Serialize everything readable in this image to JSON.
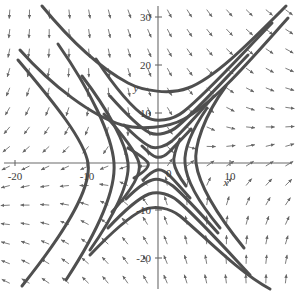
{
  "chart_data": {
    "type": "scatter",
    "title": "",
    "subtitle": "",
    "xlabel": "x",
    "ylabel": "y",
    "xlim": [
      -22.1,
      19.2
    ],
    "ylim": [
      -27.1,
      34.0
    ],
    "grid": false,
    "legend": null,
    "annotations": [],
    "plot_kind": "direction-field-phase-portrait",
    "xticks": [
      -20,
      -10,
      0,
      10
    ],
    "xtick_labels": [
      "-20",
      "-10",
      "0",
      "10"
    ],
    "yticks": [
      -20,
      -10,
      10,
      20,
      30
    ],
    "ytick_labels": [
      "-20",
      "-10",
      "10",
      "20",
      "30"
    ],
    "origin_label": "0",
    "field": {
      "arrow_color": "#5a5a5a",
      "arrow_count_x": 15,
      "arrow_count_y": 15,
      "quadrant_directions": {
        "upper_left": "up-left",
        "upper_right": "right-up",
        "lower_left": "down",
        "lower_right": "down-right"
      }
    },
    "trajectory_color": "#4f4f4f",
    "axis_color": "#6b6b6b",
    "background": "#ffffff",
    "trajectories": [
      {
        "name": "upper-branch-1",
        "quadrant": "top",
        "vertex": [
          0,
          16
        ]
      },
      {
        "name": "upper-branch-2",
        "quadrant": "top",
        "vertex": [
          0,
          8
        ]
      },
      {
        "name": "upper-branch-3",
        "quadrant": "top",
        "vertex": [
          0,
          3
        ]
      },
      {
        "name": "lower-branch-1",
        "quadrant": "bottom",
        "vertex": [
          0,
          -3
        ]
      },
      {
        "name": "lower-branch-2",
        "quadrant": "bottom",
        "vertex": [
          0,
          -8
        ]
      },
      {
        "name": "lower-branch-3",
        "quadrant": "bottom",
        "vertex": [
          0,
          -12
        ]
      },
      {
        "name": "left-branch-1",
        "quadrant": "left",
        "vertex": [
          -2.5,
          0
        ]
      },
      {
        "name": "left-branch-2",
        "quadrant": "left",
        "vertex": [
          -5,
          0
        ]
      },
      {
        "name": "left-branch-3",
        "quadrant": "left",
        "vertex": [
          -8,
          0
        ]
      },
      {
        "name": "right-branch-1",
        "quadrant": "right",
        "vertex": [
          2,
          0
        ]
      },
      {
        "name": "separatrix-stable",
        "quadrant": "diagonal",
        "vertex": [
          0,
          0
        ]
      },
      {
        "name": "separatrix-unstable",
        "quadrant": "diagonal",
        "vertex": [
          0,
          0
        ]
      }
    ]
  }
}
